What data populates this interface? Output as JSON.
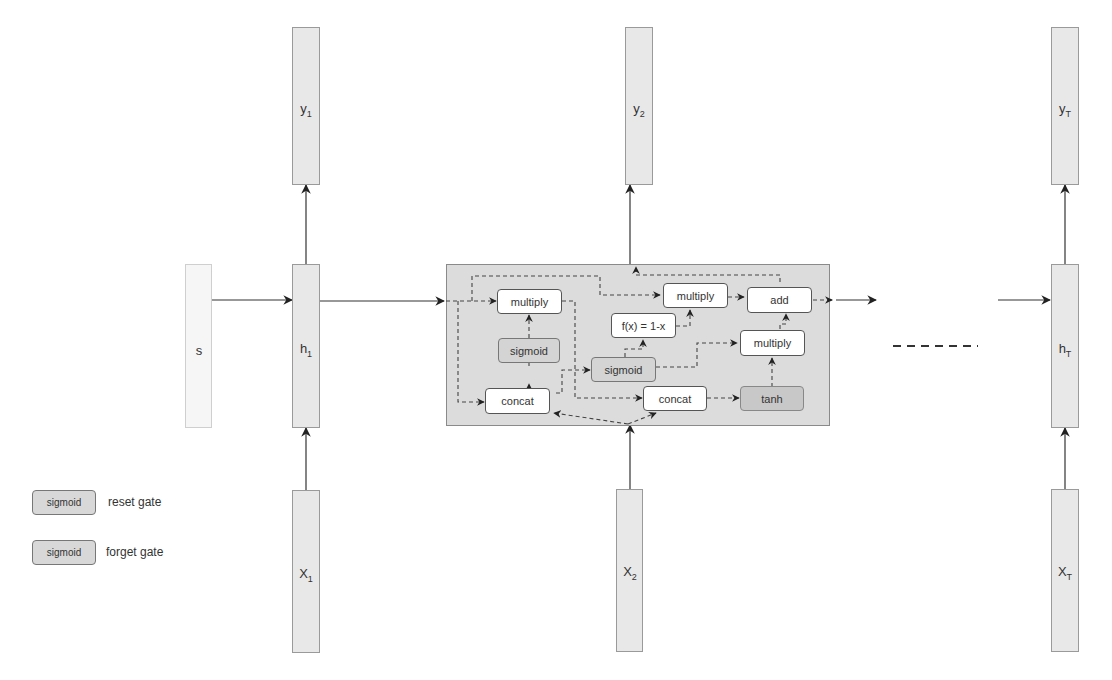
{
  "diagram": {
    "type": "GRU recurrent network unrolled over time",
    "inputs": [
      {
        "id": "x1",
        "base": "X",
        "sub": "1"
      },
      {
        "id": "x2",
        "base": "X",
        "sub": "2"
      },
      {
        "id": "xT",
        "base": "X",
        "sub": "T"
      }
    ],
    "hidden": [
      {
        "id": "h1",
        "base": "h",
        "sub": "1"
      },
      {
        "id": "hT",
        "base": "h",
        "sub": "T"
      }
    ],
    "outputs": [
      {
        "id": "y1",
        "base": "y",
        "sub": "1"
      },
      {
        "id": "y2",
        "base": "y",
        "sub": "2"
      },
      {
        "id": "yT",
        "base": "y",
        "sub": "T"
      }
    ],
    "initial_state": {
      "label": "s"
    },
    "ellipsis": "------",
    "cell_ops": {
      "multiply_reset": "multiply",
      "sigmoid_reset": "sigmoid",
      "concat_1": "concat",
      "sigmoid_forget": "sigmoid",
      "one_minus": "f(x) = 1-x",
      "multiply_top": "multiply",
      "add": "add",
      "multiply_right": "multiply",
      "concat_2": "concat",
      "tanh": "tanh"
    }
  },
  "legend": [
    {
      "box": "sigmoid",
      "text": "reset gate"
    },
    {
      "box": "sigmoid",
      "text": "forget gate"
    }
  ]
}
